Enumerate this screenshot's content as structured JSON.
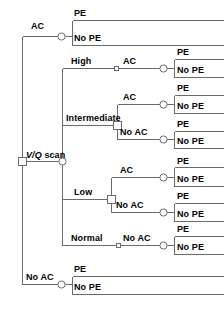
{
  "diagram": {
    "type": "decision-tree",
    "root": {
      "label": "V/Q scan",
      "label_italic_part": "V/Q",
      "label_plain_part": " scan",
      "node_type": "decision-square"
    },
    "colors": {
      "line": "#6b6b6b",
      "text": "#000000",
      "background": "#ffffff",
      "node_stroke": "#6b6b6b",
      "node_fill": "#ffffff"
    },
    "branches": [
      {
        "id": "ac",
        "label": "AC",
        "node_type": "chance-circle",
        "outcomes": [
          "PE",
          "No PE"
        ]
      },
      {
        "id": "vq-scan",
        "label": "V/Q scan",
        "node_type": "chance-circle",
        "categories": [
          {
            "id": "high",
            "label": "High",
            "node_type": "none",
            "subbranches": [
              {
                "label": "AC",
                "outcomes": [
                  "PE",
                  "No PE"
                ]
              }
            ]
          },
          {
            "id": "intermediate",
            "label": "Intermediate",
            "node_type": "decision-square",
            "subbranches": [
              {
                "label": "AC",
                "outcomes": [
                  "PE",
                  "No PE"
                ]
              },
              {
                "label": "No AC",
                "outcomes": [
                  "PE",
                  "No PE"
                ]
              }
            ]
          },
          {
            "id": "low",
            "label": "Low",
            "node_type": "decision-square",
            "subbranches": [
              {
                "label": "AC",
                "outcomes": [
                  "PE",
                  "No PE"
                ]
              },
              {
                "label": "No AC",
                "outcomes": [
                  "PE",
                  "No PE"
                ]
              }
            ]
          },
          {
            "id": "normal",
            "label": "Normal",
            "node_type": "none",
            "subbranches": [
              {
                "label": "No AC",
                "outcomes": [
                  "PE",
                  "No PE"
                ]
              }
            ]
          }
        ]
      },
      {
        "id": "no-ac",
        "label": "No AC",
        "node_type": "chance-circle",
        "outcomes": [
          "PE",
          "No PE"
        ]
      }
    ],
    "labels": {
      "ac_top": "AC",
      "pe_1": "PE",
      "nope_1": "No PE",
      "high": "High",
      "ac_high": "AC",
      "pe_2": "PE",
      "nope_2": "No PE",
      "ac_inter": "AC",
      "pe_3": "PE",
      "nope_3": "No PE",
      "intermediate": "Intermediate",
      "noac_inter": "No AC",
      "pe_4": "PE",
      "nope_4": "No PE",
      "vq_scan_italic": "V/Q",
      "vq_scan_plain": " scan",
      "ac_low": "AC",
      "pe_5": "PE",
      "nope_5": "No PE",
      "low": "Low",
      "noac_low": "No AC",
      "pe_6": "PE",
      "nope_6": "No PE",
      "normal": "Normal",
      "noac_normal": "No AC",
      "pe_7": "PE",
      "nope_7": "No PE",
      "noac_bottom": "No AC",
      "pe_8": "PE",
      "nope_8": "No PE"
    }
  }
}
